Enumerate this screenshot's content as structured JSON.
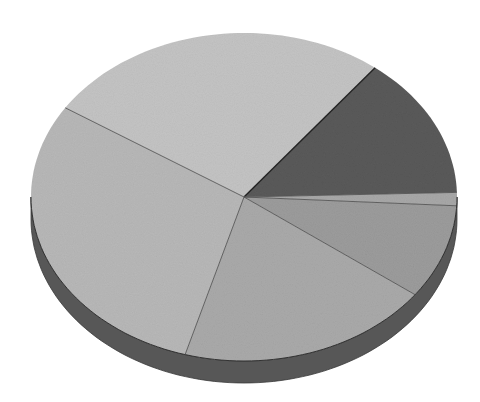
{
  "chart_data": {
    "type": "pie",
    "style": "3d-tilted",
    "title": "",
    "legend": "none",
    "labels_shown": false,
    "slices": [
      {
        "name": "slice-dark",
        "value": 14.0,
        "color": "#5a5a5a"
      },
      {
        "name": "slice-thin",
        "value": 1.3,
        "color": "#a8a8a8"
      },
      {
        "name": "slice-right-mid",
        "value": 9.3,
        "color": "#9c9c9c"
      },
      {
        "name": "slice-bottom",
        "value": 19.3,
        "color": "#aaaaaa"
      },
      {
        "name": "slice-left",
        "value": 29.7,
        "color": "#b8b8b8"
      },
      {
        "name": "slice-top",
        "value": 26.4,
        "color": "#c4c4c4"
      }
    ],
    "start_angle_deg": -52,
    "geometry": {
      "cx": 244,
      "cy": 197,
      "rx": 213,
      "ry": 164,
      "depth": 22
    },
    "side_color": "#575757",
    "edge_color": "#3a3a3a"
  }
}
